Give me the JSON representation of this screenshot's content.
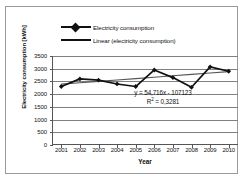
{
  "chart_data": {
    "type": "line",
    "title": "",
    "xlabel": "Year",
    "ylabel": "Electricity consumption [kWh]",
    "categories": [
      "2001",
      "2002",
      "2003",
      "2004",
      "2005",
      "2006",
      "2007",
      "2008",
      "2009",
      "2010"
    ],
    "ylim": [
      0,
      3500
    ],
    "ytick_step": 500,
    "yticks": [
      "3500",
      "3000",
      "2500",
      "2000",
      "1500",
      "1000",
      "500",
      "0"
    ],
    "grid": "horizontal",
    "legend_position": "top",
    "series": [
      {
        "name": "Electricity consumption",
        "type": "line-marker",
        "marker": "diamond",
        "color": "#111111",
        "values": [
          2300,
          2600,
          2550,
          2400,
          2300,
          2950,
          2650,
          2270,
          3070,
          2900
        ]
      },
      {
        "name": "Linear (electricity consumption)",
        "type": "trendline",
        "color": "#555555",
        "values": [
          2393,
          2448,
          2502,
          2557,
          2612,
          2667,
          2721,
          2776,
          2831,
          2886
        ]
      }
    ],
    "annotations": {
      "equation": "y = 54,716x - 107123",
      "r_squared_prefix": "R",
      "r_squared_sup": "2",
      "r_squared_value": " = 0,3281"
    }
  },
  "legend": {
    "items": [
      {
        "label": "Electricity consumption"
      },
      {
        "label": "Linear (electricity consumption)"
      }
    ]
  },
  "colors": {
    "series": "#111111",
    "trend": "#555555",
    "grid": "#808080",
    "axis": "#555555",
    "border": "#9a9a9a"
  }
}
